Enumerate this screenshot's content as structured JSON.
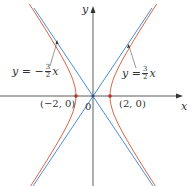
{
  "chart_data": {
    "type": "diagram",
    "title": "",
    "xlabel": "x",
    "ylabel": "y",
    "origin_label": "0",
    "vertices": [
      {
        "label": "(-2, 0)",
        "x": -2,
        "y": 0
      },
      {
        "label": "(2, 0)",
        "x": 2,
        "y": 0
      }
    ],
    "asymptotes": [
      {
        "label_lhs": "y = ",
        "sign": "−",
        "num": "3",
        "den": "2",
        "var": "x",
        "slope": -1.5
      },
      {
        "label_lhs": "y = ",
        "sign": "",
        "num": "3",
        "den": "2",
        "var": "x",
        "slope": 1.5
      }
    ],
    "hyperbola": {
      "a": 2,
      "b": 3,
      "orientation": "horizontal"
    },
    "colors": {
      "hyperbola": "#d9674a",
      "asymptote": "#4a8fd0",
      "axis": "#333333",
      "vertex": "#b8322a"
    }
  },
  "labels": {
    "y_axis": "y",
    "x_axis": "x",
    "origin": "0",
    "left_vertex": "(−2, 0)",
    "right_vertex": "(2, 0)",
    "left_eq_prefix": "y = −",
    "right_eq_prefix": "y = ",
    "frac_num": "3",
    "frac_den": "2",
    "eq_var": "x"
  }
}
